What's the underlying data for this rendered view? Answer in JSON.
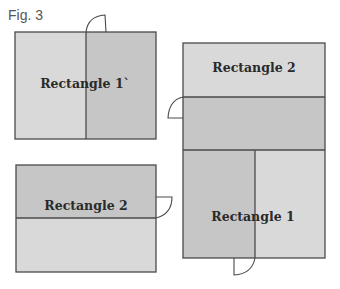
{
  "figure": {
    "label": "Fig. 3",
    "colors": {
      "light": "#d9d9d9",
      "dark": "#c6c6c6",
      "stroke": "#4a4a4a"
    },
    "shapes": [
      {
        "id": "rect-1-prime",
        "label": "Rectangle 1`",
        "split": "vertical"
      },
      {
        "id": "rect-2-bottom-left",
        "label": "Rectangle 2",
        "split": "horizontal"
      },
      {
        "id": "composite-right-top",
        "label": "Rectangle 2"
      },
      {
        "id": "composite-right-bottom",
        "label": "Rectangle 1"
      }
    ]
  }
}
